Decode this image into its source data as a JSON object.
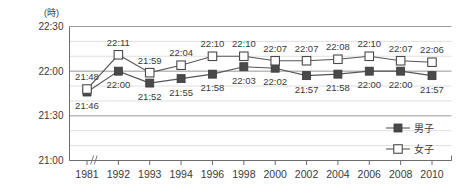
{
  "chart_data": {
    "type": "line",
    "title": "",
    "xlabel": "",
    "ylabel": "",
    "unit_label": "(時)",
    "grid": true,
    "legend_position": "bottom-right",
    "categories": [
      "1981",
      "1992",
      "1993",
      "1994",
      "1996",
      "1998",
      "2000",
      "2002",
      "2004",
      "2006",
      "2008",
      "2010"
    ],
    "ytick_labels": [
      "22:30",
      "22:00",
      "21:30",
      "21:00"
    ],
    "ytick_minutes": [
      1350,
      1320,
      1290,
      1260
    ],
    "ylim_minutes": [
      1260,
      1350
    ],
    "axis_break_after_category": "1981",
    "series": [
      {
        "name": "男子",
        "marker": "filled-square",
        "color": "#4a4a4a",
        "labels": [
          "21:46",
          "22:00",
          "21:52",
          "21:55",
          "21:58",
          "22:03",
          "22:02",
          "21:57",
          "21:58",
          "22:00",
          "22:00",
          "21:57"
        ],
        "values": [
          1306,
          1320,
          1312,
          1315,
          1318,
          1323,
          1322,
          1317,
          1318,
          1320,
          1320,
          1317
        ]
      },
      {
        "name": "女子",
        "marker": "open-square",
        "color": "#ffffff",
        "labels": [
          "21:48",
          "22:11",
          "21:59",
          "22:04",
          "22:10",
          "22:10",
          "22:07",
          "22:07",
          "22:08",
          "22:10",
          "22:07",
          "22:06"
        ],
        "values": [
          1308,
          1331,
          1319,
          1324,
          1330,
          1330,
          1327,
          1327,
          1328,
          1330,
          1327,
          1326
        ]
      }
    ]
  },
  "legend": {
    "items": [
      {
        "label": "男子",
        "marker": "filled-square"
      },
      {
        "label": "女子",
        "marker": "open-square"
      }
    ]
  }
}
